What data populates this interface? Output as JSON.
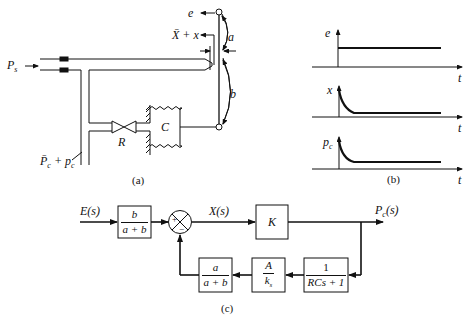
{
  "figure": {
    "panels": [
      {
        "id": "a",
        "caption": "(a)"
      },
      {
        "id": "b",
        "caption": "(b)"
      },
      {
        "id": "c",
        "caption": "(c)"
      }
    ]
  },
  "mechanism": {
    "supply_pressure": "P",
    "supply_pressure_sub": "s",
    "output_pressure": "P̄",
    "output_pressure_sub": "c",
    "output_pressure_plus": " + p",
    "output_pressure_plus_sub": "c",
    "input_label": "e",
    "nozzle_gap": "X̄ + x",
    "lever_upper": "a",
    "lever_lower": "b",
    "restriction": "R",
    "capacitance": "C"
  },
  "responses": {
    "time_axis": "t",
    "plots": [
      {
        "ylabel": "e",
        "shape": "step"
      },
      {
        "ylabel": "x",
        "shape": "decay-to-constant"
      },
      {
        "ylabel": "p",
        "ylabel_sub": "c",
        "shape": "decay-to-constant"
      }
    ]
  },
  "block_diagram": {
    "input": "E(s)",
    "error": "X(s)",
    "output": "P",
    "output_sub": "c",
    "output_suffix": "(s)",
    "sum_plus": "+",
    "sum_minus": "−",
    "forward_gain_block": {
      "num": "b",
      "den": "a + b"
    },
    "controller_block": "K",
    "feedback_blocks": [
      {
        "num": "1",
        "den": "RCs + 1"
      },
      {
        "num": "A",
        "den": "k",
        "den_sub": "s"
      },
      {
        "num": "a",
        "den": "a + b"
      }
    ]
  }
}
